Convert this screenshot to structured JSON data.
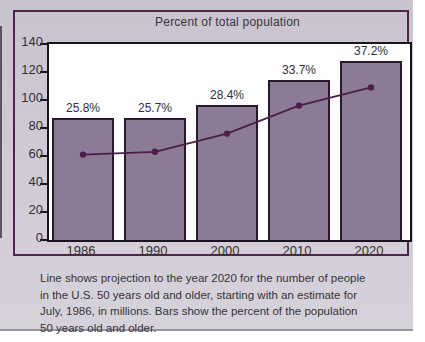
{
  "chart_data": {
    "type": "combo-bar-line",
    "title": "Percent of total population",
    "categories": [
      "1986",
      "1990",
      "2000",
      "2010",
      "2020"
    ],
    "series": [
      {
        "name": "Percent of the population 50 years old and older (bars)",
        "type": "bar",
        "data_labels": [
          "25.8%",
          "25.7%",
          "28.4%",
          "33.7%",
          "37.2%"
        ],
        "label_values_percent": [
          25.8,
          25.7,
          28.4,
          33.7,
          37.2
        ],
        "plotted_heights_axis_units": [
          87.5,
          87,
          96.5,
          114.5,
          128
        ]
      },
      {
        "name": "Projected number of people in the U.S. 50 years old and older, in millions (line)",
        "type": "line",
        "values": [
          61,
          63,
          76,
          96,
          109
        ]
      }
    ],
    "xlabel": "",
    "ylabel": "",
    "ylim": [
      0,
      140
    ],
    "yticks": [
      0,
      20,
      40,
      60,
      80,
      100,
      120,
      140
    ],
    "grid": false,
    "legend": "none",
    "caption": "Line shows projection to the year 2020 for the number of people in the U.S. 50 years old and older, starting with an estimate for July, 1986, in millions.  Bars show the percent of the population 50 years old and older.",
    "caption_lines": [
      "Line shows projection to the year 2020 for the number of people",
      "in the U.S. 50 years old and older, starting with an estimate for",
      "July, 1986, in millions.  Bars show the percent of the population",
      "50 years old and older."
    ],
    "colors": {
      "bar_fill": "#8c7b95",
      "bar_border": "#261a29",
      "line": "#4b1f49",
      "plot_bg": "#fdfdfe",
      "plot_border": "#1a141f",
      "card_bg": "#d0cbd6",
      "frame_border": "#4e2647",
      "text": "#323036"
    }
  }
}
